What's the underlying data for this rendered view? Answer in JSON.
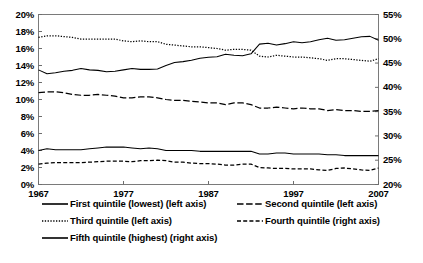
{
  "chart_data": {
    "type": "line",
    "title": "",
    "subtitle": "",
    "xlabel": "",
    "ylabel": "",
    "grid": false,
    "legend_position": "bottom",
    "x": [
      1967,
      1968,
      1969,
      1970,
      1971,
      1972,
      1973,
      1974,
      1975,
      1976,
      1977,
      1978,
      1979,
      1980,
      1981,
      1982,
      1983,
      1984,
      1985,
      1986,
      1987,
      1988,
      1989,
      1990,
      1991,
      1992,
      1993,
      1994,
      1995,
      1996,
      1997,
      1998,
      1999,
      2000,
      2001,
      2002,
      2003,
      2004,
      2005,
      2006,
      2007
    ],
    "x_tick_labels": [
      "1967",
      "1977",
      "1987",
      "1997",
      "2007"
    ],
    "x_tick_values": [
      1967,
      1977,
      1987,
      1997,
      2007
    ],
    "xlim": [
      1967,
      2007
    ],
    "axes": [
      {
        "id": "left",
        "side": "left",
        "ylim": [
          0,
          20
        ],
        "tick_step": 2,
        "tick_labels": [
          "0%",
          "2%",
          "4%",
          "6%",
          "8%",
          "10%",
          "12%",
          "14%",
          "16%",
          "18%",
          "20%"
        ],
        "tick_values": [
          0,
          2,
          4,
          6,
          8,
          10,
          12,
          14,
          16,
          18,
          20
        ]
      },
      {
        "id": "right",
        "side": "right",
        "ylim": [
          20,
          55
        ],
        "tick_step": 5,
        "tick_labels": [
          "20%",
          "25%",
          "30%",
          "35%",
          "40%",
          "45%",
          "50%",
          "55%"
        ],
        "tick_values": [
          20,
          25,
          30,
          35,
          40,
          45,
          50,
          55
        ]
      }
    ],
    "series": [
      {
        "name": "First quintile (lowest) (left axis)",
        "short_name": "First quintile (lowest)",
        "axis": "left",
        "style": "solid",
        "color": "#000000",
        "values": [
          4.0,
          4.2,
          4.1,
          4.1,
          4.1,
          4.1,
          4.2,
          4.3,
          4.4,
          4.4,
          4.4,
          4.3,
          4.2,
          4.3,
          4.2,
          4.0,
          4.0,
          4.0,
          4.0,
          3.9,
          3.9,
          3.9,
          3.9,
          3.9,
          3.9,
          3.9,
          3.6,
          3.6,
          3.7,
          3.7,
          3.6,
          3.6,
          3.6,
          3.6,
          3.5,
          3.5,
          3.4,
          3.4,
          3.4,
          3.4,
          3.4
        ]
      },
      {
        "name": "Second quintile (left axis)",
        "short_name": "Second quintile",
        "axis": "left",
        "style": "longdash",
        "color": "#000000",
        "values": [
          10.8,
          10.9,
          10.9,
          10.8,
          10.6,
          10.5,
          10.5,
          10.6,
          10.5,
          10.4,
          10.2,
          10.2,
          10.3,
          10.3,
          10.2,
          10.0,
          9.9,
          9.9,
          9.8,
          9.7,
          9.6,
          9.6,
          9.4,
          9.6,
          9.6,
          9.4,
          9.0,
          9.0,
          9.1,
          9.0,
          8.9,
          9.0,
          8.9,
          8.9,
          8.7,
          8.8,
          8.7,
          8.7,
          8.6,
          8.6,
          8.7
        ]
      },
      {
        "name": "Third quintile (left axis)",
        "short_name": "Third quintile",
        "axis": "left",
        "style": "dotted",
        "color": "#000000",
        "values": [
          17.3,
          17.5,
          17.5,
          17.4,
          17.3,
          17.1,
          17.1,
          17.1,
          17.1,
          17.1,
          16.9,
          16.8,
          16.9,
          16.8,
          16.8,
          16.5,
          16.4,
          16.3,
          16.2,
          16.2,
          16.1,
          16.0,
          15.8,
          15.9,
          15.9,
          15.8,
          15.1,
          15.0,
          15.2,
          15.1,
          15.0,
          15.0,
          14.9,
          14.8,
          14.6,
          14.8,
          14.8,
          14.7,
          14.6,
          14.5,
          14.8
        ]
      },
      {
        "name": "Fourth quintile (right axis)",
        "short_name": "Fourth quintile",
        "axis": "right",
        "style": "dash",
        "color": "#000000",
        "values": [
          24.2,
          24.4,
          24.5,
          24.5,
          24.5,
          24.5,
          24.6,
          24.7,
          24.8,
          24.8,
          24.8,
          24.7,
          24.9,
          24.9,
          25.0,
          24.9,
          24.6,
          24.6,
          24.4,
          24.3,
          24.3,
          24.2,
          24.0,
          24.0,
          24.2,
          24.2,
          23.5,
          23.4,
          23.3,
          23.3,
          23.2,
          23.2,
          23.2,
          23.0,
          22.9,
          23.3,
          23.4,
          23.2,
          23.0,
          22.9,
          23.4
        ]
      },
      {
        "name": "Fifth quintile (highest) (right axis)",
        "short_name": "Fifth quintile (highest)",
        "axis": "right",
        "style": "solid",
        "color": "#000000",
        "values": [
          43.6,
          42.8,
          43.0,
          43.3,
          43.5,
          43.9,
          43.6,
          43.5,
          43.2,
          43.3,
          43.6,
          43.9,
          43.7,
          43.7,
          43.8,
          44.5,
          45.1,
          45.3,
          45.6,
          46.0,
          46.2,
          46.3,
          46.8,
          46.6,
          46.5,
          46.9,
          48.9,
          49.1,
          48.7,
          49.0,
          49.4,
          49.2,
          49.4,
          49.8,
          50.1,
          49.7,
          49.8,
          50.1,
          50.4,
          50.5,
          49.7
        ]
      }
    ]
  },
  "legend": {
    "entries": [
      {
        "label": "First quintile (lowest) (left axis)",
        "style": "solid",
        "column": 0
      },
      {
        "label": "Second quintile (left axis)",
        "style": "longdash",
        "column": 1
      },
      {
        "label": "Third quintile (left axis)",
        "style": "dotted",
        "column": 0
      },
      {
        "label": "Fourth quintile (right axis)",
        "style": "dash",
        "column": 1
      },
      {
        "label": "Fifth quintile (highest) (right axis)",
        "style": "solid",
        "column": 0
      }
    ]
  }
}
